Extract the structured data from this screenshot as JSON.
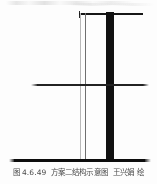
{
  "figure": {
    "caption": {
      "label": "图",
      "number": "4.6.49",
      "title": "方案二结构示意图",
      "author": "王兴娟",
      "credit_verb": "绘",
      "full_text": "图 4.6.49 方案二结构示意图 王兴娟 绘"
    },
    "diagram": {
      "description": "方案二结构示意图",
      "elements": [
        {
          "name": "core-column",
          "kind": "vertical-solid-column",
          "color": "#111111"
        },
        {
          "name": "wall-line-outer",
          "kind": "vertical-thin-line",
          "color": "#b9b9b9"
        },
        {
          "name": "wall-line-inner",
          "kind": "vertical-thin-line",
          "color": "#6f6f6f"
        },
        {
          "name": "roof-beam",
          "kind": "horizontal-beam",
          "color": "#171717"
        },
        {
          "name": "floor-beam",
          "kind": "horizontal-beam",
          "color": "#232323"
        },
        {
          "name": "ground-line",
          "kind": "horizontal-baseline",
          "color": "#0d0d0d"
        }
      ],
      "colors": {
        "ink": "#111111",
        "light_ink": "#b9b9b9",
        "paper": "#fdfdfd",
        "caption_text": "#4a4a4a"
      }
    }
  }
}
